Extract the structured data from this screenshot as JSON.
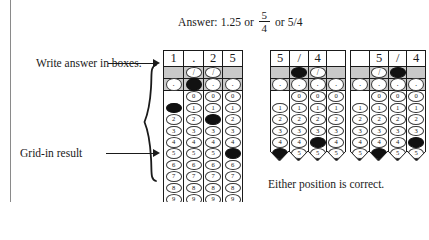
{
  "header": {
    "answer_prefix": "Answer: 1.25 or",
    "fraction_numerator": "5",
    "fraction_denominator": "4",
    "answer_suffix": "or 5/4"
  },
  "callouts": {
    "write_answer": "Write answer in boxes.",
    "grid_in_result": "Grid-in result",
    "either_position": "Either position is correct."
  },
  "grids": [
    {
      "name": "grid-decimal",
      "headers": [
        "1",
        ".",
        "2",
        "5"
      ],
      "slash_row": [
        null,
        "/",
        "/",
        null
      ],
      "slash_filled": [
        false,
        false,
        false,
        false
      ],
      "dot_row": [
        ".",
        ".",
        ".",
        "."
      ],
      "dot_filled": [
        false,
        true,
        false,
        false
      ],
      "digits": [
        "0",
        "1",
        "2",
        "3",
        "4",
        "5",
        "6",
        "7",
        "8",
        "9"
      ],
      "col_digit_start": [
        1,
        0,
        0,
        0
      ],
      "filled_digits": [
        1,
        null,
        2,
        5
      ],
      "torn_bottom": false
    },
    {
      "name": "grid-fraction-left",
      "headers": [
        "5",
        "/",
        "4",
        ""
      ],
      "slash_row": [
        null,
        "/",
        "/",
        null
      ],
      "slash_filled": [
        false,
        true,
        false,
        false
      ],
      "dot_row": [
        ".",
        ".",
        ".",
        "."
      ],
      "dot_filled": [
        false,
        false,
        false,
        false
      ],
      "digits": [
        "0",
        "1",
        "2",
        "3",
        "4",
        "5"
      ],
      "col_digit_start": [
        1,
        0,
        0,
        0
      ],
      "filled_digits": [
        5,
        null,
        4,
        null
      ],
      "torn_bottom": true
    },
    {
      "name": "grid-fraction-right",
      "headers": [
        "",
        "5",
        "/",
        "4"
      ],
      "slash_row": [
        null,
        "/",
        "/",
        null
      ],
      "slash_filled": [
        false,
        false,
        true,
        false
      ],
      "dot_row": [
        ".",
        ".",
        ".",
        "."
      ],
      "dot_filled": [
        false,
        false,
        false,
        false
      ],
      "digits": [
        "0",
        "1",
        "2",
        "3",
        "4",
        "5"
      ],
      "col_digit_start": [
        1,
        0,
        0,
        0
      ],
      "filled_digits": [
        null,
        5,
        null,
        4
      ],
      "torn_bottom": true
    }
  ],
  "colors": {
    "shaded_row": "#c9c9c9",
    "ink": "#1a1a1a",
    "filled_bubble": "#111111"
  }
}
